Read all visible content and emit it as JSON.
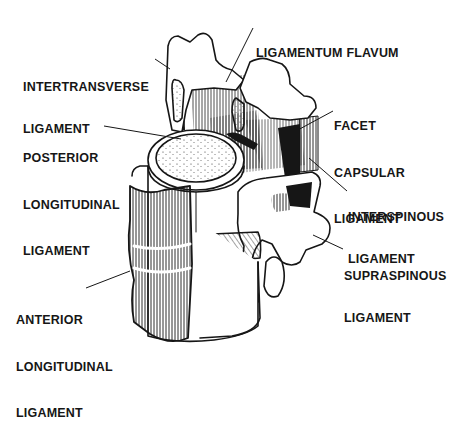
{
  "diagram": {
    "colors": {
      "background": "#ffffff",
      "ink": "#161616"
    },
    "labels": {
      "ligamentum_flavum": {
        "lines": [
          "LIGAMENTUM FLAVUM"
        ]
      },
      "intertransverse": {
        "lines": [
          "INTERTRANSVERSE",
          "LIGAMENT"
        ]
      },
      "facet_capsular": {
        "lines": [
          "FACET",
          "CAPSULAR",
          "LIGAMENT"
        ]
      },
      "posterior_longitudinal": {
        "lines": [
          "POSTERIOR",
          "LONGITUDINAL",
          "LIGAMENT"
        ]
      },
      "interspinous": {
        "lines": [
          "INTERSPINOUS",
          "LIGAMENT"
        ]
      },
      "supraspinous": {
        "lines": [
          "SUPRASPINOUS",
          "LIGAMENT"
        ]
      },
      "anterior_longitudinal": {
        "lines": [
          "ANTERIOR",
          "LONGITUDINAL",
          "LIGAMENT"
        ]
      }
    }
  }
}
